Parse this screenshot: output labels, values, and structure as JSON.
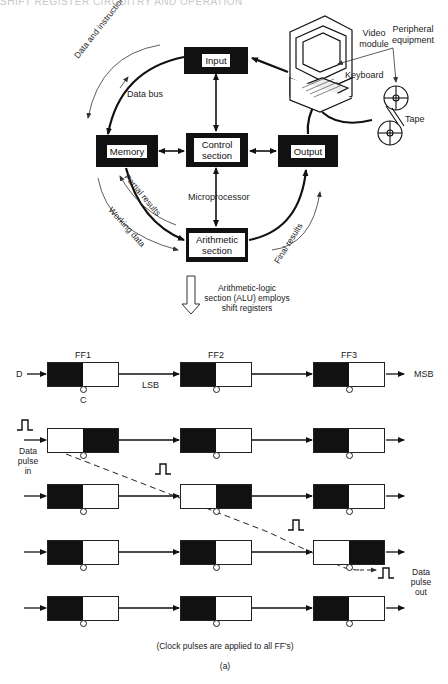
{
  "page_header": {
    "title": "SHIFT REGISTER CIRCUITRY AND OPERATION",
    "page_number": "??"
  },
  "microprocessor_diagram": {
    "blocks": {
      "input": "Input",
      "memory": "Memory",
      "control": "Control section",
      "output": "Output",
      "arithmetic": "Arithmetic section"
    },
    "labels": {
      "data_and_instructions": "Data and instructions",
      "data_bus": "Data bus",
      "microprocessor": "Microprocessor",
      "partial_results": "Partial results",
      "working_data": "Working data",
      "final_results": "Final results",
      "video_module": "Video module",
      "keyboard": "Keyboard",
      "peripheral_equipment": "Peripheral equipment",
      "tape": "Tape"
    }
  },
  "transition": {
    "arrow_icon": "down-arrow-hollow",
    "caption": "Arithmetic-logic section (ALU) employs shift registers"
  },
  "shift_register": {
    "flip_flops": [
      "FF1",
      "FF2",
      "FF3"
    ],
    "input_label": "D",
    "clock_label": "C",
    "lsb_label": "LSB",
    "msb_label": "MSB",
    "data_pulse_in": "Data pulse in",
    "data_pulse_out": "Data pulse out",
    "rows": [
      {
        "states": [
          "dark-left",
          "dark-left",
          "dark-left"
        ]
      },
      {
        "states": [
          "dark-right",
          "dark-left",
          "dark-left"
        ]
      },
      {
        "states": [
          "dark-left",
          "dark-right",
          "dark-left"
        ]
      },
      {
        "states": [
          "dark-left",
          "dark-left",
          "dark-right"
        ]
      },
      {
        "states": [
          "dark-left",
          "dark-left",
          "dark-left"
        ]
      }
    ],
    "footnote": "(Clock pulses are applied to all FF's)",
    "figure_label": "(a)"
  }
}
